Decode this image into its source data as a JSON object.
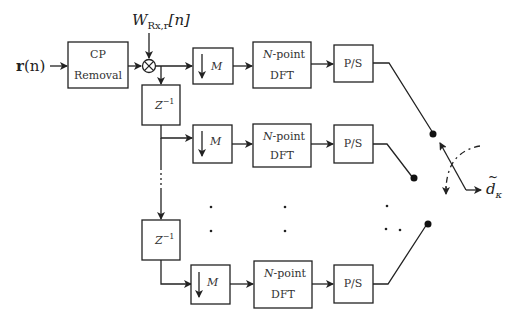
{
  "diagram": {
    "input_label": "r(n)",
    "input_bold": "r",
    "input_arg": "(n)",
    "weight_label": "W",
    "weight_sub": "Rx,r",
    "weight_arg": "[n]",
    "cp_block": {
      "line1": "CP",
      "line2": "Removal"
    },
    "delay_block": {
      "base": "Z",
      "exp": "−1"
    },
    "downsample_block": {
      "symbol": "↓",
      "label": "M"
    },
    "dft_block": {
      "line1_italic": "N",
      "line1_rest": "-point",
      "line2": "DFT"
    },
    "ps_block": {
      "label": "P/S"
    },
    "output_label": "d",
    "output_sub": "κ",
    "output_accent": "~",
    "branches": [
      {
        "row": 1,
        "y": 66
      },
      {
        "row": 2,
        "y": 138
      },
      {
        "row": "ellipsis"
      },
      {
        "row": "N",
        "y": 283
      }
    ]
  }
}
